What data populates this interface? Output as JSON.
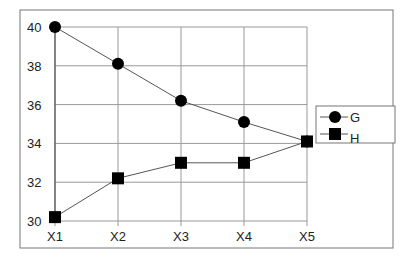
{
  "chart_data": {
    "type": "line",
    "title": "",
    "xlabel": "",
    "ylabel": "",
    "categories": [
      "X1",
      "X2",
      "X3",
      "X4",
      "X5"
    ],
    "series": [
      {
        "name": "G",
        "marker": "circle",
        "values": [
          40.0,
          38.1,
          36.2,
          35.1,
          34.1
        ]
      },
      {
        "name": "H",
        "marker": "square",
        "values": [
          30.2,
          32.2,
          33.0,
          33.0,
          34.1
        ]
      }
    ],
    "ylim": [
      30,
      40
    ],
    "yticks": [
      30,
      32,
      34,
      36,
      38,
      40
    ],
    "grid": true,
    "legend_position": "right"
  },
  "legend": {
    "items": [
      {
        "label": "G"
      },
      {
        "label": "H"
      }
    ]
  },
  "colors": {
    "line": "#555555",
    "marker": "#000000",
    "grid": "#888888",
    "frame": "#777777"
  }
}
